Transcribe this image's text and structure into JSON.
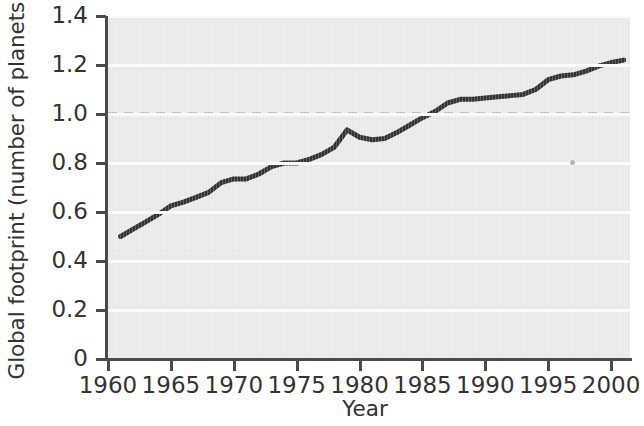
{
  "chart_data": {
    "type": "line",
    "title": "",
    "xlabel": "Year",
    "ylabel": "Global footprint (number of planets)",
    "xlim": [
      1960,
      2001.5
    ],
    "ylim": [
      0,
      1.4
    ],
    "grid": true,
    "legend": null,
    "x_ticks": [
      "1960",
      "1965",
      "1970",
      "1975",
      "1980",
      "1985",
      "1990",
      "1995",
      "2000"
    ],
    "x_tick_values": [
      1960,
      1965,
      1970,
      1975,
      1980,
      1985,
      1990,
      1995,
      2000
    ],
    "y_ticks": [
      "0",
      "0.2",
      "0.4",
      "0.6",
      "0.8",
      "1.0",
      "1.2",
      "1.4"
    ],
    "y_tick_values": [
      0,
      0.2,
      0.4,
      0.6,
      0.8,
      1.0,
      1.2,
      1.4
    ],
    "series": [
      {
        "name": "Global footprint",
        "color": "#333333",
        "line_width": 5,
        "x": [
          1961,
          1962,
          1963,
          1964,
          1965,
          1966,
          1967,
          1968,
          1969,
          1970,
          1971,
          1972,
          1973,
          1974,
          1975,
          1976,
          1977,
          1978,
          1979,
          1980,
          1981,
          1982,
          1983,
          1984,
          1985,
          1986,
          1987,
          1988,
          1989,
          1990,
          1991,
          1992,
          1993,
          1994,
          1995,
          1996,
          1997,
          1998,
          1999,
          2000,
          2001
        ],
        "values": [
          0.5,
          0.53,
          0.56,
          0.59,
          0.625,
          0.64,
          0.66,
          0.68,
          0.72,
          0.735,
          0.735,
          0.755,
          0.785,
          0.8,
          0.8,
          0.815,
          0.835,
          0.865,
          0.935,
          0.905,
          0.895,
          0.9,
          0.925,
          0.955,
          0.985,
          1.01,
          1.045,
          1.06,
          1.06,
          1.065,
          1.07,
          1.075,
          1.08,
          1.1,
          1.14,
          1.155,
          1.16,
          1.175,
          1.195,
          1.21,
          1.22
        ]
      }
    ],
    "reference_lines": [
      {
        "name": "one-planet-capacity",
        "axis": "y",
        "value": 1.0,
        "style": "dashed",
        "color": "#333333"
      }
    ],
    "annotations": [
      {
        "name": "scan-speck",
        "x_px": 570,
        "y_px": 160,
        "label": ""
      }
    ]
  }
}
